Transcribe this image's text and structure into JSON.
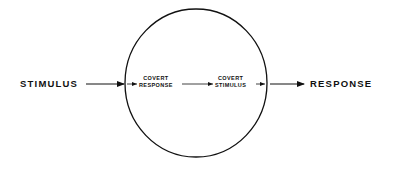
{
  "diagram": {
    "input_label": "STIMULUS",
    "output_label": "RESPONSE",
    "inner": {
      "covert_response": [
        "COVERT",
        "RESPONSE"
      ],
      "covert_stimulus": [
        "COVERT",
        "STIMULUS"
      ]
    },
    "colors": {
      "stroke": "#111111",
      "background": "#ffffff"
    }
  }
}
